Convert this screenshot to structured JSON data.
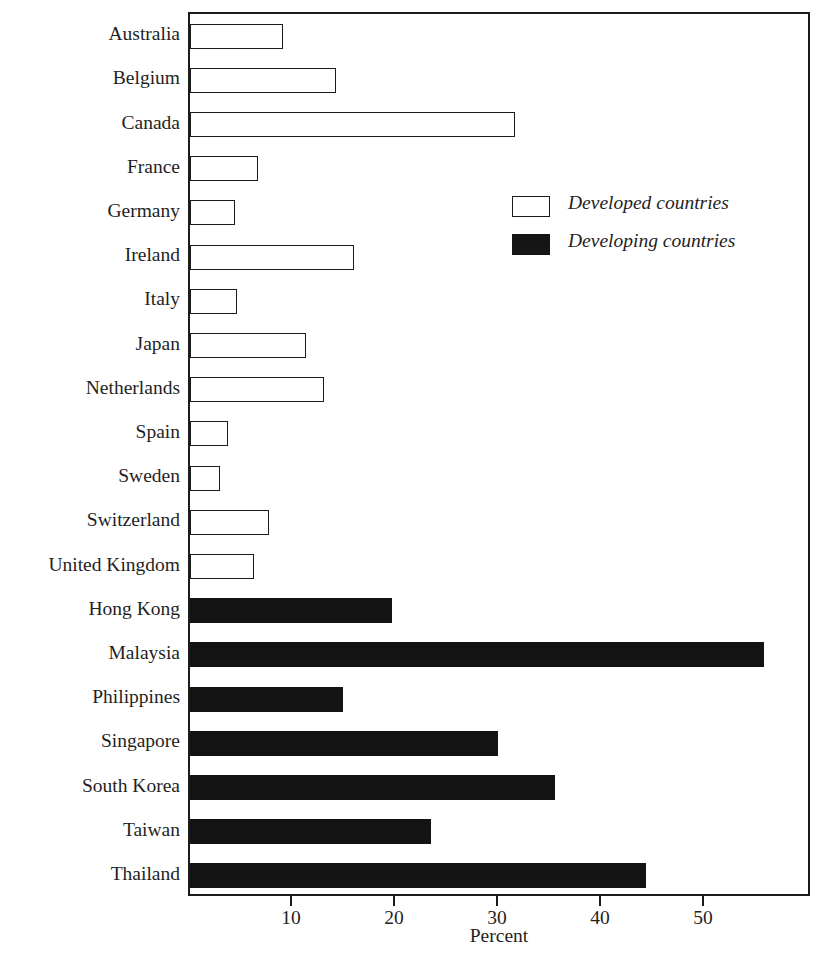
{
  "figure": {
    "title_remnant": "",
    "xaxis_title": "Percent"
  },
  "legend": {
    "position": "upper-right-inside",
    "items": [
      {
        "label": "Developed countries",
        "swatch": "open-square-icon",
        "fill": "#ffffff"
      },
      {
        "label": "Developing countries",
        "swatch": "filled-square-icon",
        "fill": "#131313"
      }
    ]
  },
  "axis": {
    "tick_labels": [
      "10",
      "20",
      "30",
      "40",
      "50"
    ],
    "tick_values": [
      10,
      20,
      30,
      40,
      50
    ],
    "x_min": 0,
    "x_max": 60.4
  },
  "chart_data": {
    "type": "bar",
    "orientation": "horizontal",
    "title": "",
    "xlabel": "Percent",
    "ylabel": "",
    "xlim": [
      0,
      60.4
    ],
    "grid": false,
    "legend_position": "upper right (inside axes)",
    "categories": [
      "Australia",
      "Belgium",
      "Canada",
      "France",
      "Germany",
      "Ireland",
      "Italy",
      "Japan",
      "Netherlands",
      "Spain",
      "Sweden",
      "Switzerland",
      "United Kingdom",
      "Hong Kong",
      "Malaysia",
      "Philippines",
      "Singapore",
      "South Korea",
      "Taiwan",
      "Thailand"
    ],
    "values": [
      9.0,
      14.2,
      31.6,
      6.6,
      4.4,
      15.9,
      4.6,
      11.3,
      13.0,
      3.7,
      2.9,
      7.7,
      6.2,
      19.6,
      55.7,
      14.9,
      29.9,
      35.4,
      23.4,
      44.3
    ],
    "series": [
      {
        "name": "Developed countries",
        "style": "open",
        "points": [
          {
            "category": "Australia",
            "value": 9.0
          },
          {
            "category": "Belgium",
            "value": 14.2
          },
          {
            "category": "Canada",
            "value": 31.6
          },
          {
            "category": "France",
            "value": 6.6
          },
          {
            "category": "Germany",
            "value": 4.4
          },
          {
            "category": "Ireland",
            "value": 15.9
          },
          {
            "category": "Italy",
            "value": 4.6
          },
          {
            "category": "Japan",
            "value": 11.3
          },
          {
            "category": "Netherlands",
            "value": 13.0
          },
          {
            "category": "Spain",
            "value": 3.7
          },
          {
            "category": "Sweden",
            "value": 2.9
          },
          {
            "category": "Switzerland",
            "value": 7.7
          },
          {
            "category": "United Kingdom",
            "value": 6.2
          }
        ]
      },
      {
        "name": "Developing countries",
        "style": "filled",
        "points": [
          {
            "category": "Hong Kong",
            "value": 19.6
          },
          {
            "category": "Malaysia",
            "value": 55.7
          },
          {
            "category": "Philippines",
            "value": 14.9
          },
          {
            "category": "Singapore",
            "value": 29.9
          },
          {
            "category": "South Korea",
            "value": 35.4
          },
          {
            "category": "Taiwan",
            "value": 23.4
          },
          {
            "category": "Thailand",
            "value": 44.3
          }
        ]
      }
    ]
  },
  "colors": {
    "developed_fill": "#ffffff",
    "developing_fill": "#131313",
    "outline": "#1c1c1c",
    "text": "#1f1f1f",
    "background": "#ffffff"
  }
}
